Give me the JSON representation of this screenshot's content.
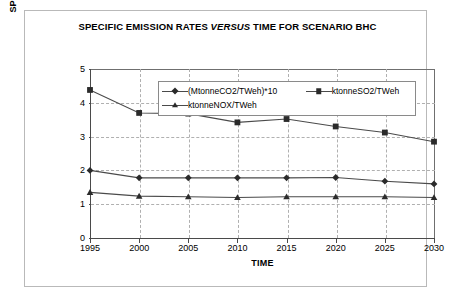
{
  "chart_data": {
    "type": "line",
    "title_line1_pre": "SPECIFIC EMISSION RATES ",
    "title_line1_em": "VERSUS",
    "title_line1_post": " TIME FOR SCENARIO",
    "title_line2": "BHC",
    "title": "SPECIFIC EMISSION RATES VERSUS TIME FOR SCENARIO BHC",
    "xlabel": "TIME",
    "ylabel_line1": "SPECIFIC EMISSION RATE,",
    "ylabel_line2": "xtonneXO2/TWeh",
    "ylabel": "SPECIFIC EMISSION RATE, xtonneXO2/TWeh",
    "x": [
      1995,
      2000,
      2005,
      2010,
      2015,
      2020,
      2025,
      2030
    ],
    "xtick_labels": [
      "1995",
      "2000",
      "2005",
      "2010",
      "2015",
      "2020",
      "2025",
      "2030"
    ],
    "ytick_labels": [
      "0",
      "1",
      "2",
      "3",
      "4",
      "5"
    ],
    "yticks": [
      0,
      1,
      2,
      3,
      4,
      5
    ],
    "ylim": [
      0,
      5
    ],
    "xlim": [
      1995,
      2030
    ],
    "grid": "horizontal-and-vertical-dashed",
    "legend_position": "top-center-inside",
    "series": [
      {
        "name": "(MtonneCO2/TWeh)*10",
        "marker": "diamond",
        "color": "#4a4a4a",
        "values": [
          2.0,
          1.78,
          1.78,
          1.78,
          1.78,
          1.79,
          1.68,
          1.6
        ]
      },
      {
        "name": "ktonneSO2/TWeh",
        "marker": "square",
        "color": "#4a4a4a",
        "values": [
          4.38,
          3.7,
          3.68,
          3.42,
          3.52,
          3.3,
          3.12,
          2.85
        ]
      },
      {
        "name": "ktonneNOX/TWeh",
        "marker": "triangle",
        "color": "#4a4a4a",
        "values": [
          1.35,
          1.24,
          1.22,
          1.2,
          1.22,
          1.22,
          1.22,
          1.2
        ]
      }
    ]
  }
}
